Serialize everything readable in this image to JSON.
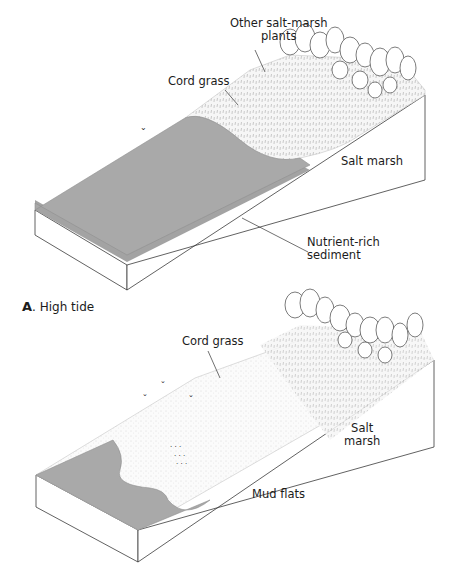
{
  "figure": {
    "panel_a": {
      "caption_letter": "A",
      "caption_text": ". High tide",
      "labels": {
        "other_plants_line1": "Other salt-marsh",
        "other_plants_line2": "plants",
        "cord_grass": "Cord grass",
        "salt_marsh": "Salt marsh",
        "sediment_line1": "Nutrient-rich",
        "sediment_line2": "sediment"
      }
    },
    "panel_b": {
      "labels": {
        "cord_grass": "Cord grass",
        "salt_marsh_line1": "Salt",
        "salt_marsh_line2": "marsh",
        "mud_flats": "Mud flats"
      }
    },
    "colors": {
      "water": "#a9a9a9",
      "water_edge": "#8e8e8e",
      "marsh": "#f2f2f2",
      "outline": "#3a3a3a",
      "background": "#ffffff"
    }
  }
}
